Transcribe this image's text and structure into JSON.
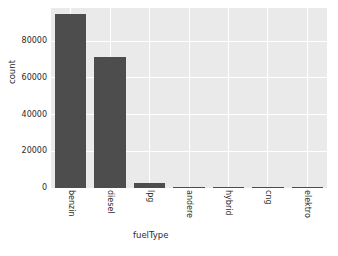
{
  "chart_data": {
    "type": "bar",
    "title": "",
    "xlabel": "fuelType",
    "ylabel": "count",
    "categories": [
      "benzin",
      "diesel",
      "lpg",
      "andere",
      "hybrid",
      "cng",
      "elektro"
    ],
    "values": [
      95000,
      71500,
      3000,
      500,
      400,
      300,
      60
    ],
    "ylim": [
      0,
      98000
    ],
    "yticks": [
      0,
      20000,
      40000,
      60000,
      80000
    ],
    "ytick_labels": [
      "0",
      "20000",
      "40000",
      "60000",
      "80000"
    ],
    "xtick_labels": [
      "benzin",
      "diesel",
      "lpg",
      "andere",
      "hybrid",
      "cng",
      "elektro"
    ],
    "grid": true,
    "legend": "none",
    "bar_color": "#4d4d4d",
    "plot_background": "#eaeaea",
    "grid_color": "#ffffff",
    "figure_background": "#ffffff"
  },
  "caption": {
    "fragment": ""
  }
}
